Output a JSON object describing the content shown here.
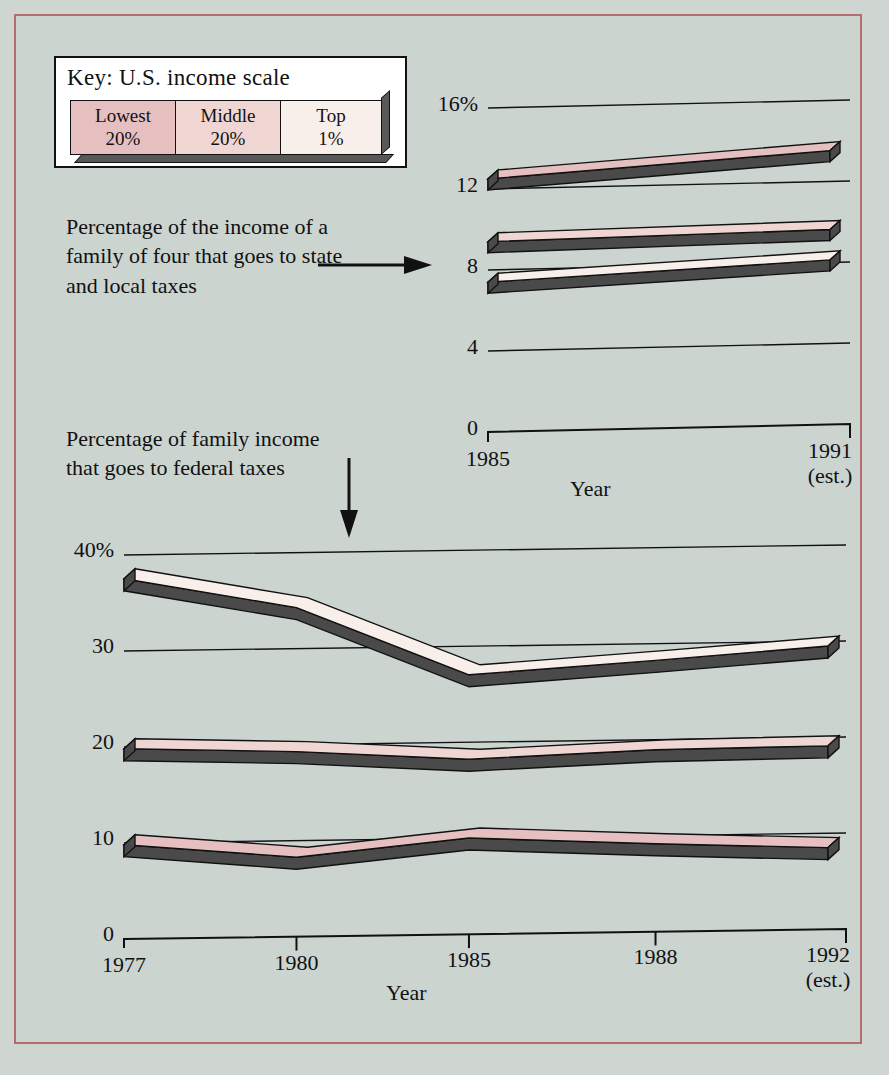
{
  "legend": {
    "title": "Key: U.S. income scale",
    "items": [
      {
        "label_line1": "Lowest",
        "label_line2": "20%",
        "color": "#e6c0c0"
      },
      {
        "label_line1": "Middle",
        "label_line2": "20%",
        "color": "#f0d6d2"
      },
      {
        "label_line1": "Top",
        "label_line2": "1%",
        "color": "#f9efea"
      }
    ]
  },
  "captions": {
    "state_local": "Percentage of the income of a family of four that goes to state and local taxes",
    "federal": "Percentage of family income that goes to federal taxes"
  },
  "colors": {
    "border": "#b56c6c",
    "background": "#ccd4d0",
    "ink": "#111111",
    "shadow": "#4a4a4a",
    "lowest20": "#e6c0c0",
    "middle20": "#f0d6d2",
    "top1": "#f9efea"
  },
  "chart_data": [
    {
      "type": "area",
      "id": "state-local-taxes",
      "title": "Percentage of the income of a family of four that goes to state and local taxes",
      "xlabel": "Year",
      "ylabel": "",
      "x": [
        "1985",
        "1991 (est.)"
      ],
      "xtick_labels": [
        {
          "line1": "1985",
          "line2": ""
        },
        {
          "line1": "1991",
          "line2": "(est.)"
        }
      ],
      "ytick_labels": [
        "16%",
        "12",
        "8",
        "4",
        "0"
      ],
      "ytick_values": [
        16,
        12,
        8,
        4,
        0
      ],
      "ylim": [
        0,
        16
      ],
      "grid": true,
      "series": [
        {
          "name": "Lowest 20%",
          "color": "#e6c0c0",
          "values": [
            12.3,
            13.7
          ]
        },
        {
          "name": "Middle 20%",
          "color": "#f0d6d2",
          "values": [
            9.2,
            9.8
          ]
        },
        {
          "name": "Top 1%",
          "color": "#f9efea",
          "values": [
            7.2,
            8.3
          ]
        }
      ]
    },
    {
      "type": "area",
      "id": "federal-taxes",
      "title": "Percentage of family income that goes to federal taxes",
      "xlabel": "Year",
      "ylabel": "",
      "x": [
        "1977",
        "1980",
        "1985",
        "1988",
        "1992 (est.)"
      ],
      "xtick_labels": [
        {
          "line1": "1977",
          "line2": ""
        },
        {
          "line1": "1980",
          "line2": ""
        },
        {
          "line1": "1985",
          "line2": ""
        },
        {
          "line1": "1988",
          "line2": ""
        },
        {
          "line1": "1992",
          "line2": "(est.)"
        }
      ],
      "ytick_labels": [
        "40%",
        "30",
        "20",
        "10",
        "0"
      ],
      "ytick_values": [
        40,
        30,
        20,
        10,
        0
      ],
      "ylim": [
        0,
        40
      ],
      "grid": true,
      "series": [
        {
          "name": "Top 1%",
          "color": "#f9efea",
          "values": [
            37.0,
            34.0,
            27.0,
            28.5,
            30.0
          ]
        },
        {
          "name": "Middle 20%",
          "color": "#f0d6d2",
          "values": [
            19.3,
            19.0,
            18.2,
            19.2,
            19.6
          ]
        },
        {
          "name": "Lowest 20%",
          "color": "#e6c0c0",
          "values": [
            9.3,
            8.0,
            10.0,
            9.4,
            9.0
          ]
        }
      ]
    }
  ]
}
